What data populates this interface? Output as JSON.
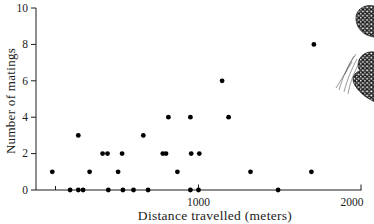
{
  "colors": {
    "background": "#ffffff",
    "axis": "#1c1c1c",
    "text": "#1c1c1c",
    "marker": "#000000"
  },
  "illustration": "butterfly-on-grass",
  "chart_data": {
    "type": "scatter",
    "title": "",
    "xlabel": "Distance travelled (meters)",
    "ylabel": "Number of matings",
    "xlim": [
      0,
      2000
    ],
    "ylim": [
      0,
      10
    ],
    "grid": false,
    "legend": "none",
    "y_tick_values": [
      0,
      2,
      4,
      6,
      8,
      10
    ],
    "x_tick_labels": [
      {
        "value": 1000,
        "label": "1000"
      },
      {
        "value": 2000,
        "label": "2000"
      }
    ],
    "x_minor_ticks": [
      120
    ],
    "marker": {
      "shape": "circle",
      "color": "#000000",
      "radius_px": 2.4
    },
    "points_xy": [
      [
        210,
        0
      ],
      [
        260,
        0
      ],
      [
        290,
        0
      ],
      [
        445,
        0
      ],
      [
        535,
        0
      ],
      [
        600,
        0
      ],
      [
        690,
        0
      ],
      [
        950,
        0
      ],
      [
        1000,
        0
      ],
      [
        1490,
        0
      ],
      [
        100,
        1
      ],
      [
        330,
        1
      ],
      [
        505,
        1
      ],
      [
        870,
        1
      ],
      [
        1320,
        1
      ],
      [
        1695,
        1
      ],
      [
        410,
        2
      ],
      [
        440,
        2
      ],
      [
        530,
        2
      ],
      [
        780,
        2
      ],
      [
        800,
        2
      ],
      [
        955,
        2
      ],
      [
        1005,
        2
      ],
      [
        260,
        3
      ],
      [
        660,
        3
      ],
      [
        815,
        4
      ],
      [
        950,
        4
      ],
      [
        1185,
        4
      ],
      [
        1145,
        6
      ],
      [
        1710,
        8
      ]
    ]
  }
}
